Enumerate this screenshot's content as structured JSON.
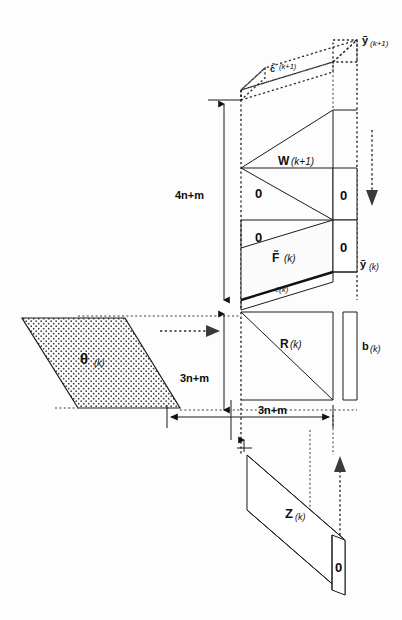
{
  "figure": {
    "background_color": "#fdfdfd",
    "line_color": "#1a1a1a"
  },
  "blocks": {
    "c_tilde_next": "c̃",
    "c_tilde_next_index": "(k+1)",
    "y_tilde_next": "ỹ",
    "y_tilde_next_index": "(k+1)",
    "w_next": "W",
    "w_next_index": "(k+1)",
    "zero_upper_left": "0",
    "zero_upper_right": "0",
    "zero_middle_left": "0",
    "zero_middle_right": "0",
    "f_tilde": "F̃",
    "f_tilde_index": "(k)",
    "c_tilde": "c̃(k)",
    "y_tilde": "ỹ",
    "y_tilde_index": "(k)",
    "r": "R",
    "r_index": "(k)",
    "b": "b",
    "b_index": "(k)",
    "theta": "θ",
    "theta_index": "(k)",
    "z": "Z",
    "z_index": "(k)",
    "zero_bottom_right": "0"
  },
  "dimensions": {
    "vertical_upper": "4n+m",
    "vertical_lower": "3n+m",
    "horizontal": "3n+m"
  }
}
